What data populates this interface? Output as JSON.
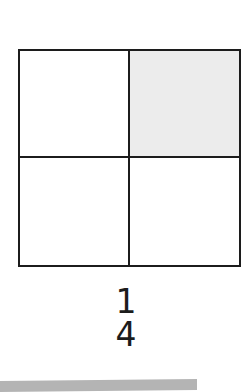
{
  "figure": {
    "type": "fraction-model",
    "grid": {
      "rows": 2,
      "cols": 2,
      "total_cells": 4,
      "shaded_count": 1,
      "cells": [
        {
          "position": "top-left",
          "shaded": false
        },
        {
          "position": "top-right",
          "shaded": true
        },
        {
          "position": "bottom-left",
          "shaded": false
        },
        {
          "position": "bottom-right",
          "shaded": false
        }
      ]
    },
    "fraction": {
      "numerator": "1",
      "denominator": "4"
    }
  },
  "colors": {
    "line": "#1c1c1c",
    "shaded_cell": "#ececec",
    "bottom_bar": "#b4b4b4",
    "background": "#ffffff"
  }
}
